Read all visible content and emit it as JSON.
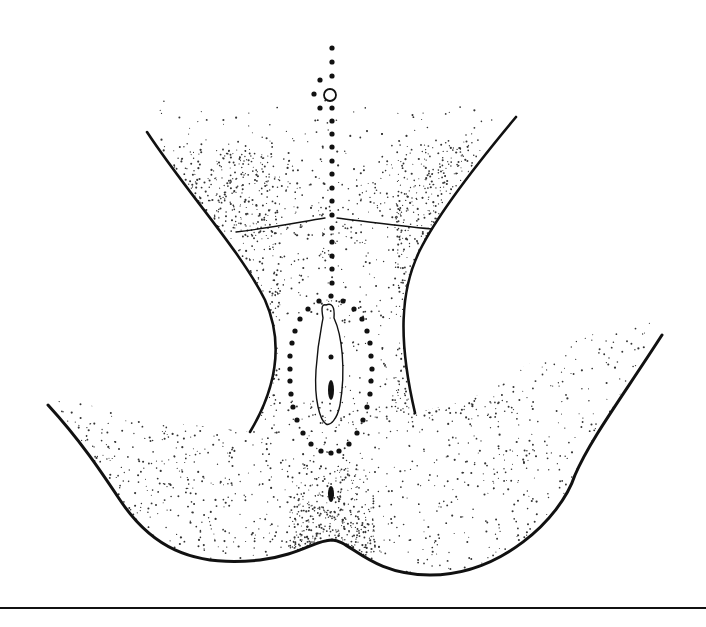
{
  "figure": {
    "width": 706,
    "height": 627,
    "background": "#ffffff",
    "ink": "#111111",
    "stipple": "#333333"
  },
  "outlines": {
    "left_inguinal_fold": "M147,132 C185,190 240,250 265,300 C285,345 275,390 250,432",
    "right_inguinal_fold": "M516,117 C480,160 440,210 420,250 C400,290 398,340 415,413",
    "mons_fold_left": "M236,232 C270,228 300,222 325,218",
    "mons_fold_right": "M337,218 C370,222 400,226 432,229",
    "left_thigh_buttock": "M48,405 C80,440 100,470 120,500 C150,545 190,568 260,560 C300,555 315,540 332,540",
    "right_thigh_buttock": "M332,540 C350,540 370,575 430,575 C500,575 560,520 575,475 C590,440 620,400 662,335",
    "baseline": {
      "x1": 0,
      "y1": 608,
      "x2": 706,
      "y2": 608
    }
  },
  "labium": {
    "path": "M326,305 C331,303 335,305 334,318 C342,335 346,370 340,405 C337,420 330,426 326,424 C320,420 314,400 316,370 C318,340 322,325 323,318 C321,307 322,304 326,305 Z",
    "inner_dot": {
      "cx": 331,
      "cy": 357,
      "r": 2.5
    },
    "inner_slit": {
      "cx": 331,
      "cy": 390,
      "rx": 3,
      "ry": 10
    }
  },
  "anal_mark": {
    "cx": 331,
    "cy": 494,
    "rx": 3,
    "ry": 8
  },
  "landmark_circle": {
    "cx": 330,
    "cy": 95,
    "r": 6
  },
  "midline_dots_x": 332,
  "midline_dots_y": [
    48,
    62,
    76,
    108,
    121,
    134,
    147,
    161,
    174,
    188,
    201,
    215,
    228,
    242,
    256,
    269,
    283
  ],
  "side_dots": [
    {
      "cx": 320,
      "cy": 80
    },
    {
      "cx": 314,
      "cy": 94
    },
    {
      "cx": 320,
      "cy": 108
    }
  ],
  "oval_dots": [
    [
      331,
      296
    ],
    [
      319,
      301
    ],
    [
      343,
      301
    ],
    [
      308,
      309
    ],
    [
      354,
      309
    ],
    [
      300,
      319
    ],
    [
      362,
      319
    ],
    [
      295,
      331
    ],
    [
      367,
      331
    ],
    [
      292,
      343
    ],
    [
      370,
      343
    ],
    [
      290,
      356
    ],
    [
      371,
      356
    ],
    [
      290,
      369
    ],
    [
      372,
      369
    ],
    [
      290,
      381
    ],
    [
      371,
      381
    ],
    [
      291,
      394
    ],
    [
      370,
      394
    ],
    [
      293,
      407
    ],
    [
      367,
      407
    ],
    [
      297,
      420
    ],
    [
      363,
      420
    ],
    [
      303,
      433
    ],
    [
      357,
      433
    ],
    [
      311,
      444
    ],
    [
      349,
      444
    ],
    [
      321,
      451
    ],
    [
      339,
      451
    ],
    [
      331,
      453
    ]
  ],
  "stipple_regions": [
    {
      "name": "mons",
      "x": 160,
      "y": 95,
      "w": 340,
      "h": 140,
      "count": 520,
      "density_bias": "top-light"
    },
    {
      "name": "left-groin",
      "x": 150,
      "y": 150,
      "w": 130,
      "h": 270,
      "count": 900,
      "density_bias": "edge"
    },
    {
      "name": "right-groin",
      "x": 395,
      "y": 140,
      "w": 120,
      "h": 280,
      "count": 800,
      "density_bias": "edge"
    },
    {
      "name": "center-lower",
      "x": 270,
      "y": 230,
      "w": 140,
      "h": 90,
      "count": 140,
      "density_bias": "uniform"
    },
    {
      "name": "perineum",
      "x": 290,
      "y": 455,
      "w": 85,
      "h": 100,
      "count": 380,
      "density_bias": "bottom"
    },
    {
      "name": "left-buttock",
      "x": 55,
      "y": 400,
      "w": 290,
      "h": 170,
      "count": 700,
      "density_bias": "edge"
    },
    {
      "name": "right-buttock",
      "x": 340,
      "y": 310,
      "w": 330,
      "h": 265,
      "count": 900,
      "density_bias": "edge"
    }
  ]
}
